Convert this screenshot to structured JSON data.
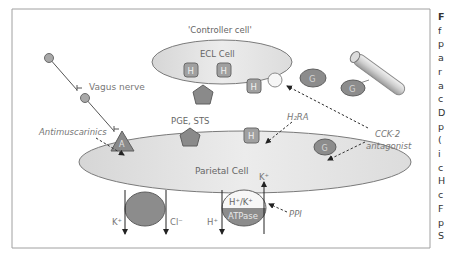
{
  "figure": {
    "controller_label": "'Controller cell'",
    "ecl_cell_label": "ECL Cell",
    "parietal_cell_label": "Parietal Cell",
    "vagus_label": "Vagus nerve",
    "antimuscarinics_label": "Antimuscarinics",
    "pge_sts_label": "PGE, STS",
    "h2ra_label": "H₂RA",
    "cck2_label": "CCK-2",
    "cck2_sub_label": "antagonist",
    "ppi_label": "PPI",
    "receptor_a": "A",
    "receptor_h": "H",
    "receptor_g": "G",
    "gastrin_g": "G",
    "ion_k_left": "K⁺",
    "ion_cl": "Cl⁻",
    "ion_h": "H⁺",
    "ion_k_right": "K⁺",
    "pump_top": "H⁺/K⁺",
    "pump_bottom": "ATPase",
    "colors": {
      "cell_fill": "#e3e3e3",
      "receptor_fill": "#8e8e8e",
      "receptor_light": "#bdbdbd",
      "text_grey": "#7a7a7a",
      "frame": "#9a9a9a"
    }
  },
  "caption_fragments": [
    "F",
    "f",
    "p",
    "a",
    "r",
    "a",
    "c",
    "D",
    "p",
    "(",
    "i",
    "c",
    "H",
    "c",
    "F",
    "p",
    "S"
  ]
}
